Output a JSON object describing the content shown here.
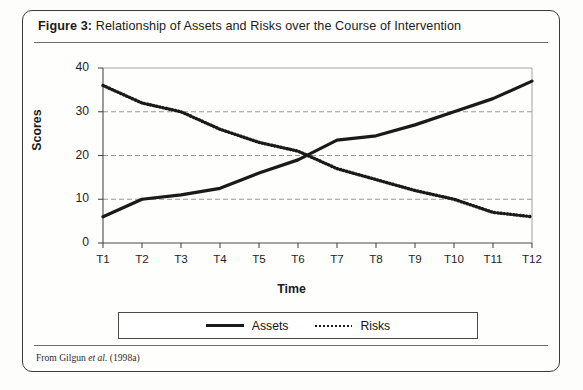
{
  "figure": {
    "caption_label": "Figure 3:",
    "caption_text": " Relationship of Assets and Risks over the Course of Intervention",
    "source_prefix": "From Gilgun ",
    "source_italic": "et al.",
    "source_suffix": " (1998a)"
  },
  "chart_data": {
    "type": "line",
    "title": "Relationship of Assets and Risks over the Course of Intervention",
    "xlabel": "Time",
    "ylabel": "Scores",
    "categories": [
      "T1",
      "T2",
      "T3",
      "T4",
      "T5",
      "T6",
      "T7",
      "T8",
      "T9",
      "T10",
      "T11",
      "T12"
    ],
    "series": [
      {
        "name": "Assets",
        "style": "solid",
        "color": "#1a1a1a",
        "values": [
          6,
          10,
          11,
          12.5,
          16,
          19,
          23.5,
          24.5,
          27,
          30,
          33,
          37
        ]
      },
      {
        "name": "Risks",
        "style": "dotted",
        "color": "#1a1a1a",
        "values": [
          36,
          32,
          30,
          26,
          23,
          21,
          17,
          14.5,
          12,
          10,
          7,
          6
        ]
      }
    ],
    "ylim": [
      0,
      40
    ],
    "yticks": [
      0,
      10,
      20,
      30,
      40
    ],
    "ytick_labels": [
      "0",
      "10",
      "20",
      "30",
      "40"
    ],
    "gridlines": [
      10,
      20,
      30
    ],
    "grid": "horizontal-dashed",
    "legend_position": "bottom",
    "legend_entries": [
      "Assets",
      "Risks"
    ]
  }
}
